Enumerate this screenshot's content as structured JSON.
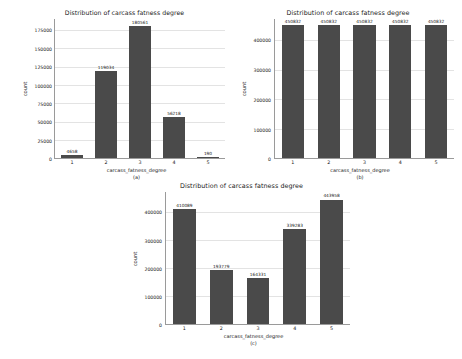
{
  "figure": {
    "background": "#ffffff",
    "bar_color": "#4a4a4a",
    "grid_color": "#e3e3e3",
    "axis_color": "#9a9a9a"
  },
  "chart_data": [
    {
      "id": "a",
      "type": "bar",
      "title": "Distribution of carcass fatness degree",
      "subcaption": "(a)",
      "xlabel": "carcass_fatness_degree",
      "ylabel": "count",
      "categories": [
        "1",
        "2",
        "3",
        "4",
        "5"
      ],
      "values": [
        4658,
        119034,
        180561,
        56218,
        190
      ],
      "value_labels": [
        "4658",
        "119034",
        "180561",
        "56218",
        "190"
      ],
      "yticks": [
        0,
        25000,
        50000,
        75000,
        100000,
        125000,
        150000,
        175000
      ],
      "ytick_labels": [
        "0",
        "25000",
        "50000",
        "75000",
        "100000",
        "125000",
        "150000",
        "175000"
      ],
      "ylim": [
        0,
        190000
      ],
      "grid": true,
      "legend": "none"
    },
    {
      "id": "b",
      "type": "bar",
      "title": "Distribution of carcass fatness degree",
      "subcaption": "(b)",
      "xlabel": "carcass_fatness_degree",
      "ylabel": "count",
      "categories": [
        "1",
        "2",
        "3",
        "4",
        "5"
      ],
      "values": [
        450832,
        450832,
        450832,
        450832,
        450832
      ],
      "value_labels": [
        "450832",
        "450832",
        "450832",
        "450832",
        "450832"
      ],
      "yticks": [
        0,
        100000,
        200000,
        300000,
        400000
      ],
      "ytick_labels": [
        "0",
        "100000",
        "200000",
        "300000",
        "400000"
      ],
      "ylim": [
        0,
        470000
      ],
      "grid": true,
      "legend": "none"
    },
    {
      "id": "c",
      "type": "bar",
      "title": "Distribution of carcass fatness degree",
      "subcaption": "(c)",
      "xlabel": "carcass_fatness_degree",
      "ylabel": "count",
      "categories": [
        "1",
        "2",
        "3",
        "4",
        "5"
      ],
      "values": [
        410089,
        193779,
        164331,
        339283,
        443958
      ],
      "value_labels": [
        "410089",
        "193779",
        "164331",
        "339283",
        "443958"
      ],
      "yticks": [
        0,
        100000,
        200000,
        300000,
        400000
      ],
      "ytick_labels": [
        "0",
        "100000",
        "200000",
        "300000",
        "400000"
      ],
      "ylim": [
        0,
        470000
      ],
      "grid": true,
      "legend": "none"
    }
  ]
}
